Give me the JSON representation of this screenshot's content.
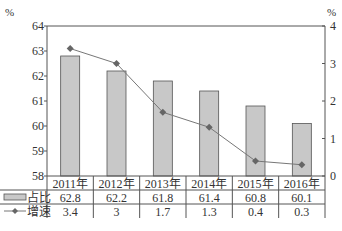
{
  "chart_data": {
    "type": "bar+line",
    "title": "",
    "categories": [
      "2011年",
      "2012年",
      "2013年",
      "2014年",
      "2015年",
      "2016年"
    ],
    "series": [
      {
        "name": "占比",
        "type": "bar",
        "axis": "left",
        "values": [
          62.8,
          62.2,
          61.8,
          61.4,
          60.8,
          60.1
        ],
        "color": "#c8c8c8"
      },
      {
        "name": "增速",
        "type": "line",
        "axis": "right",
        "marker": "diamond",
        "values": [
          3.4,
          3,
          1.7,
          1.3,
          0.4,
          0.3
        ],
        "color": "#666666"
      }
    ],
    "left_axis": {
      "unit": "%",
      "ylim": [
        58,
        64
      ],
      "ticks": [
        58,
        59,
        60,
        61,
        62,
        63,
        64
      ]
    },
    "right_axis": {
      "unit": "%",
      "ylim": [
        0,
        4
      ],
      "ticks": [
        0,
        1,
        2,
        3,
        4
      ]
    },
    "xlabel": "",
    "grid": false,
    "legend": {
      "position": "data-table-left",
      "entries": [
        "占比",
        "增速"
      ]
    },
    "data_table": true
  },
  "labels": {
    "left_unit": "%",
    "right_unit": "%"
  }
}
